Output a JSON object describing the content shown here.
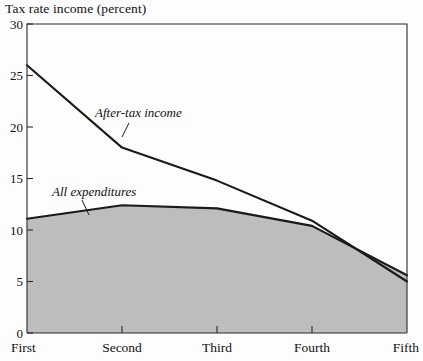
{
  "chart_data": {
    "type": "area",
    "title": "Tax rate income (percent)",
    "xlabel": "",
    "ylabel": "Tax rate income (percent)",
    "categories": [
      "First",
      "Second",
      "Third",
      "Fourth",
      "Fifth"
    ],
    "ylim": [
      0,
      30
    ],
    "y_ticks": [
      0,
      5,
      10,
      15,
      20,
      25,
      30
    ],
    "grid": false,
    "legend_position": "inline-annotations",
    "series": [
      {
        "name": "After-tax income",
        "values": [
          26.0,
          18.0,
          14.8,
          10.9,
          5.0
        ],
        "style": "line",
        "label_x_category": "Second",
        "annotation": "After-tax income"
      },
      {
        "name": "All expenditures",
        "values": [
          11.1,
          12.4,
          12.1,
          10.4,
          5.6
        ],
        "style": "filled-area",
        "fill_color": "#bdbdbd",
        "annotation": "All expenditures"
      }
    ],
    "annotations": [
      {
        "text": "After-tax income",
        "x": 95,
        "y": 117
      },
      {
        "text": "All expenditures",
        "x": 52,
        "y": 196
      }
    ],
    "colors": {
      "line": "#1a1a1a",
      "fill": "#bdbdbd",
      "frame": "#2b2b2b",
      "background": "#fdfdfd"
    }
  }
}
